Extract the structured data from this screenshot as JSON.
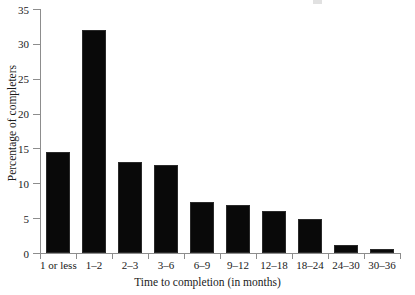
{
  "figure": {
    "background_color": "#ffffff",
    "bar_color": "#090909",
    "axis_color": "#8d8d8d",
    "text_color": "#1a1a1a"
  },
  "chart_data": {
    "type": "bar",
    "title": "",
    "xlabel": "Time to completion (in months)",
    "ylabel": "Percentage of completers",
    "categories": [
      "1 or less",
      "1–2",
      "2–3",
      "3–6",
      "6–9",
      "9–12",
      "12–18",
      "18–24",
      "24–30",
      "30–36"
    ],
    "values": [
      14.5,
      32.0,
      13.0,
      12.6,
      7.3,
      6.9,
      6.0,
      4.9,
      1.1,
      0.6
    ],
    "ylim": [
      0,
      35
    ],
    "ytick_values": [
      0,
      5,
      10,
      15,
      20,
      25,
      30,
      35
    ],
    "ytick_labels": [
      "0",
      "5",
      "10",
      "15",
      "20",
      "25",
      "30",
      "35"
    ],
    "grid": false,
    "legend": null
  }
}
